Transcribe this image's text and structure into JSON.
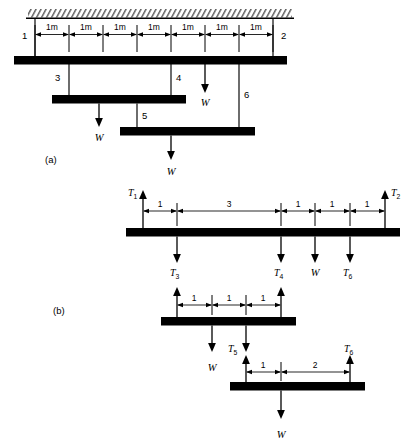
{
  "figure": {
    "panels": [
      {
        "id": "a",
        "label": "(a)",
        "caption": "Suspended beam assembly hung from ceiling"
      },
      {
        "id": "b",
        "label": "(b)",
        "caption": "Free body diagrams of separated beams"
      }
    ]
  },
  "panel_a": {
    "label": "(a)",
    "ceiling": {
      "hatch_label": "fixed-support-hatching"
    },
    "dimensions": {
      "unit_labels": [
        "1m",
        "1m",
        "1m",
        "1m",
        "1m",
        "1m",
        "1m"
      ],
      "segment_count": 7,
      "total_span": "7m"
    },
    "node_labels": [
      "1",
      "2",
      "3",
      "4",
      "5",
      "6"
    ],
    "load_labels": [
      "W",
      "W",
      "W"
    ],
    "beams": [
      {
        "name": "top-beam",
        "nodes": [
          "1",
          "2"
        ]
      },
      {
        "name": "middle-beam",
        "nodes": [
          "3",
          "4"
        ]
      },
      {
        "name": "bottom-beam",
        "nodes": [
          "5",
          "6"
        ]
      }
    ]
  },
  "panel_b": {
    "label": "(b)",
    "beam_top": {
      "name": "top-beam-fbd",
      "up_forces": [
        {
          "label": "T",
          "sub": "1",
          "position": "left-end"
        },
        {
          "label": "T",
          "sub": "2",
          "position": "right-end"
        }
      ],
      "down_forces": [
        {
          "label": "T",
          "sub": "3"
        },
        {
          "label": "T",
          "sub": "4"
        },
        {
          "label": "W",
          "sub": ""
        },
        {
          "label": "T",
          "sub": "6"
        }
      ],
      "dimensions": [
        "1",
        "3",
        "1",
        "1",
        "1"
      ]
    },
    "beam_middle": {
      "name": "middle-beam-fbd",
      "up_forces": [
        {
          "label": "T",
          "sub": "3",
          "position": "left-end"
        },
        {
          "label": "T",
          "sub": "4",
          "position": "right-end"
        }
      ],
      "down_forces": [
        {
          "label": "W",
          "sub": ""
        },
        {
          "label": "T",
          "sub": "5"
        }
      ],
      "dimensions": [
        "1",
        "1",
        "1"
      ]
    },
    "beam_bottom": {
      "name": "bottom-beam-fbd",
      "up_forces": [
        {
          "label": "T",
          "sub": "5",
          "position": "left-end"
        },
        {
          "label": "T",
          "sub": "6",
          "position": "right-end"
        }
      ],
      "down_forces": [
        {
          "label": "W",
          "sub": ""
        }
      ],
      "dimensions": [
        "1",
        "2"
      ]
    }
  },
  "colors": {
    "ink": "#000000",
    "paper": "#ffffff"
  }
}
